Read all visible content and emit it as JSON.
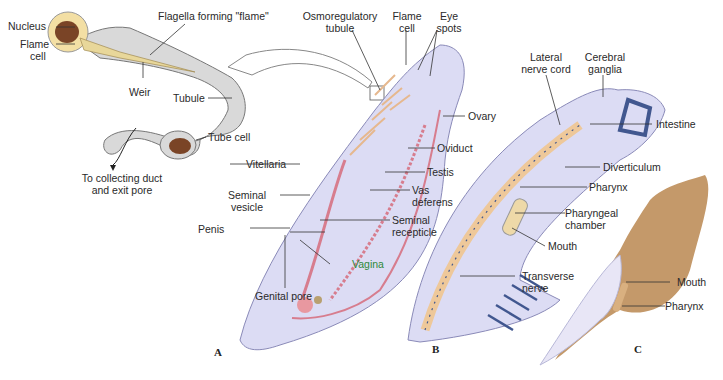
{
  "diagram": {
    "panels": [
      {
        "id": "A",
        "label": "A"
      },
      {
        "id": "B",
        "label": "B"
      },
      {
        "id": "C",
        "label": "C"
      }
    ],
    "flame_cell_inset": {
      "nucleus": "Nucleus",
      "flame_cell_1": "Flame",
      "flame_cell_2": "cell",
      "flagella": "Flagella forming \"flame\"",
      "weir": "Weir",
      "tubule": "Tubule",
      "tube_cell": "Tube cell",
      "collecting_1": "To collecting duct",
      "collecting_2": "and exit pore"
    },
    "panel_a": {
      "osmo_1": "Osmoregulatory",
      "osmo_2": "tubule",
      "flame_1": "Flame",
      "flame_2": "cell",
      "eye_1": "Eye",
      "eye_2": "spots",
      "ovary": "Ovary",
      "oviduct": "Oviduct",
      "testis": "Testis",
      "vas_1": "Vas",
      "vas_2": "deferens",
      "sem_rec_1": "Seminal",
      "sem_rec_2": "recepticle",
      "vagina": "Vagina",
      "genital_pore": "Genital pore",
      "penis": "Penis",
      "sem_ves_1": "Seminal",
      "sem_ves_2": "vesicle",
      "vitellaria": "Vitellaria"
    },
    "panel_b": {
      "lateral_1": "Lateral",
      "lateral_2": "nerve cord",
      "cerebral_1": "Cerebral",
      "cerebral_2": "ganglia",
      "intestine": "Intestine",
      "diverticulum": "Diverticulum",
      "pharynx": "Pharynx",
      "chamber_1": "Pharyngeal",
      "chamber_2": "chamber",
      "mouth": "Mouth",
      "transverse_1": "Transverse",
      "transverse_2": "nerve"
    },
    "panel_c": {
      "mouth": "Mouth",
      "pharynx": "Pharynx"
    },
    "colors": {
      "body": "#dcdcf4",
      "body_outline": "#8a8ab8",
      "flame_cell": "#f3dfa4",
      "nucleus": "#7a4426",
      "reproductive": "#d77d8e",
      "excretory": "#e6b88e",
      "nerve": "#41578f",
      "tan_body": "#c4996a",
      "vagina_label": "#2e8a3a"
    }
  }
}
